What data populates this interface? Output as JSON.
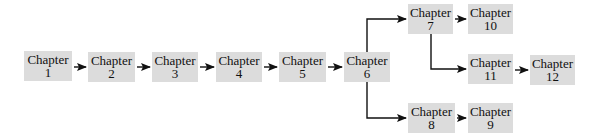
{
  "diagram": {
    "type": "flowchart",
    "nodes": [
      {
        "id": "ch1",
        "title": "Chapter",
        "number": "1",
        "x": 24,
        "y": 51,
        "w": 48,
        "h": 30
      },
      {
        "id": "ch2",
        "title": "Chapter",
        "number": "2",
        "x": 88,
        "y": 52,
        "w": 47,
        "h": 30
      },
      {
        "id": "ch3",
        "title": "Chapter",
        "number": "3",
        "x": 152,
        "y": 52,
        "w": 46,
        "h": 30
      },
      {
        "id": "ch4",
        "title": "Chapter",
        "number": "4",
        "x": 216,
        "y": 52,
        "w": 46,
        "h": 30
      },
      {
        "id": "ch5",
        "title": "Chapter",
        "number": "5",
        "x": 279,
        "y": 52,
        "w": 47,
        "h": 30
      },
      {
        "id": "ch6",
        "title": "Chapter",
        "number": "6",
        "x": 344,
        "y": 52,
        "w": 46,
        "h": 30
      },
      {
        "id": "ch7",
        "title": "Chapter",
        "number": "7",
        "x": 408,
        "y": 4,
        "w": 45,
        "h": 30
      },
      {
        "id": "ch10",
        "title": "Chapter",
        "number": "10",
        "x": 468,
        "y": 4,
        "w": 45,
        "h": 30
      },
      {
        "id": "ch11",
        "title": "Chapter",
        "number": "11",
        "x": 468,
        "y": 54,
        "w": 45,
        "h": 30
      },
      {
        "id": "ch12",
        "title": "Chapter",
        "number": "12",
        "x": 530,
        "y": 55,
        "w": 45,
        "h": 30
      },
      {
        "id": "ch8",
        "title": "Chapter",
        "number": "8",
        "x": 408,
        "y": 103,
        "w": 47,
        "h": 30
      },
      {
        "id": "ch9",
        "title": "Chapter",
        "number": "9",
        "x": 468,
        "y": 103,
        "w": 45,
        "h": 30
      }
    ],
    "edges": [
      {
        "from": "ch1",
        "to": "ch2"
      },
      {
        "from": "ch2",
        "to": "ch3"
      },
      {
        "from": "ch3",
        "to": "ch4"
      },
      {
        "from": "ch4",
        "to": "ch5"
      },
      {
        "from": "ch5",
        "to": "ch6"
      },
      {
        "from": "ch6",
        "to": "ch7"
      },
      {
        "from": "ch6",
        "to": "ch8"
      },
      {
        "from": "ch7",
        "to": "ch10"
      },
      {
        "from": "ch7",
        "to": "ch11"
      },
      {
        "from": "ch11",
        "to": "ch12"
      },
      {
        "from": "ch8",
        "to": "ch9"
      }
    ],
    "colors": {
      "box_fill": "#dcdcdc",
      "line": "#111111",
      "text": "#111111"
    }
  }
}
